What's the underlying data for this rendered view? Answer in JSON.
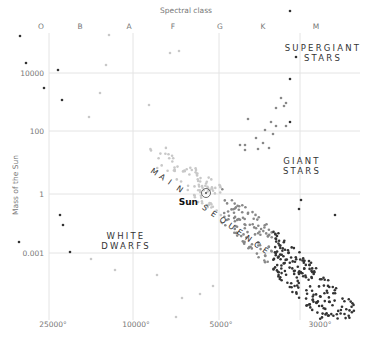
{
  "chart_data": {
    "type": "scatter",
    "x_axis_top_title": "Spectral class",
    "spectral_classes": [
      "O",
      "B",
      "A",
      "F",
      "G",
      "K",
      "M"
    ],
    "ylabel": "Mass of the Sun",
    "y_ticks": [
      "10000",
      "100",
      "1",
      "0.001"
    ],
    "x_ticks": [
      "25000°",
      "10000°",
      "5000°",
      "3000°"
    ],
    "region_labels": {
      "supergiant": [
        "SUPERGIANT",
        "STARS"
      ],
      "giant": [
        "GIANT",
        "STARS"
      ],
      "white_dwarf": [
        "WHITE",
        "DWARFS"
      ],
      "main_sequence": "MAIN SEQUENCE",
      "sun": "Sun"
    },
    "grid": true,
    "legend": "none",
    "colors": {
      "grid": "#e2e2e2",
      "dark": "#333333",
      "mid": "#888888",
      "light": "#c8c8c8"
    },
    "points_px": [
      [
        20,
        36,
        "d"
      ],
      [
        26,
        63,
        "d"
      ],
      [
        58,
        70,
        "d"
      ],
      [
        44,
        88,
        "d"
      ],
      [
        62,
        100,
        "d"
      ],
      [
        89,
        117,
        "l"
      ],
      [
        100,
        93,
        "l"
      ],
      [
        149,
        105,
        "l"
      ],
      [
        106,
        65,
        "l"
      ],
      [
        170,
        53,
        "l"
      ],
      [
        179,
        51,
        "l"
      ],
      [
        109,
        35,
        "l"
      ],
      [
        19,
        242,
        "d"
      ],
      [
        60,
        215,
        "d"
      ],
      [
        63,
        225,
        "d"
      ],
      [
        70,
        252,
        "d"
      ],
      [
        91,
        259,
        "l"
      ],
      [
        115,
        270,
        "l"
      ],
      [
        182,
        298,
        "l"
      ],
      [
        213,
        286,
        "l"
      ],
      [
        200,
        294,
        "l"
      ],
      [
        157,
        275,
        "l"
      ],
      [
        176,
        317,
        "l"
      ],
      [
        290,
        11,
        "d"
      ],
      [
        296,
        57,
        "d"
      ],
      [
        290,
        79,
        "d"
      ],
      [
        290,
        122,
        "d"
      ],
      [
        284,
        106,
        "m"
      ],
      [
        281,
        98,
        "m"
      ],
      [
        286,
        103,
        "m"
      ],
      [
        276,
        108,
        "m"
      ],
      [
        271,
        122,
        "m"
      ],
      [
        276,
        126,
        "m"
      ],
      [
        265,
        130,
        "m"
      ],
      [
        273,
        134,
        "m"
      ],
      [
        286,
        126,
        "m"
      ],
      [
        269,
        148,
        "m"
      ],
      [
        263,
        143,
        "m"
      ],
      [
        256,
        138,
        "m"
      ],
      [
        245,
        145,
        "m"
      ],
      [
        245,
        150,
        "m"
      ],
      [
        258,
        149,
        "m"
      ],
      [
        248,
        119,
        "m"
      ],
      [
        240,
        145,
        "m"
      ],
      [
        299,
        209,
        "d"
      ],
      [
        301,
        200,
        "d"
      ],
      [
        335,
        215,
        "d"
      ]
    ]
  }
}
